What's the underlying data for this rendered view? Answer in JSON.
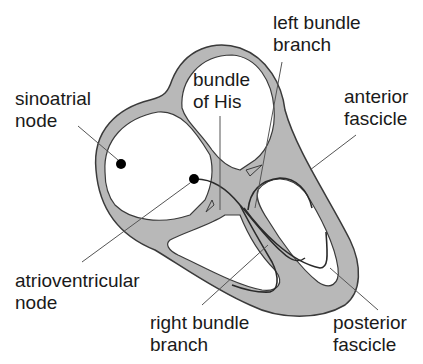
{
  "diagram": {
    "colors": {
      "wall_fill": "#b8b8b8",
      "outline": "#3a3a3a",
      "pointer": "#555555",
      "node": "#000000",
      "text": "#1a1a1a"
    },
    "labels": {
      "sinoatrial": {
        "line1": "sinoatrial",
        "line2": "node"
      },
      "bundle_his": {
        "line1": "bundle",
        "line2": "of His"
      },
      "left_bundle": {
        "line1": "left bundle",
        "line2": "branch"
      },
      "anterior": {
        "line1": "anterior",
        "line2": "fascicle"
      },
      "atrioventricular": {
        "line1": "atrioventricular",
        "line2": "node"
      },
      "right_bundle": {
        "line1": "right bundle",
        "line2": "branch"
      },
      "posterior": {
        "line1": "posterior",
        "line2": "fascicle"
      }
    }
  }
}
